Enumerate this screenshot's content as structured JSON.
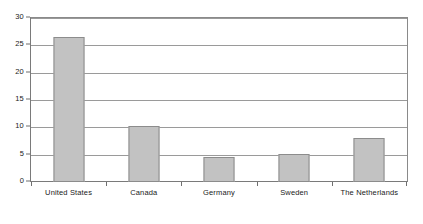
{
  "chart_data": {
    "type": "bar",
    "title": "",
    "subtitle": "",
    "xlabel": "",
    "ylabel": "",
    "categories": [
      "United States",
      "Canada",
      "Germany",
      "Sweden",
      "The Netherlands"
    ],
    "values": [
      26.5,
      10.3,
      4.6,
      5.2,
      8.0
    ],
    "series": [
      {
        "name": "",
        "values": [
          26.5,
          10.3,
          4.6,
          5.2,
          8.0
        ]
      }
    ],
    "ylim": [
      0,
      30
    ],
    "ytick_labels": [
      "0",
      "5",
      "10",
      "15",
      "20",
      "25",
      "30"
    ],
    "ytick_values": [
      0,
      5,
      10,
      15,
      20,
      25,
      30
    ],
    "grid": true,
    "grid_axis": "y",
    "legend": false,
    "legend_position": "none",
    "annotations": [],
    "colors": {
      "bar_fill": "#c2c2c2",
      "bar_border": "#8c8c8c",
      "gridline": "#9a9a9a",
      "axis": "#7a7a7a",
      "text": "#1a1a1a",
      "background": "#ffffff"
    }
  }
}
